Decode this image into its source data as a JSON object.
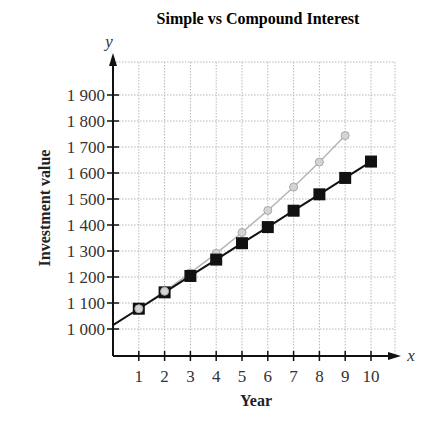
{
  "chart_data": {
    "type": "line",
    "title": "Simple vs Compound Interest",
    "xlabel": "Year",
    "ylabel": "Investment value",
    "x_var": "x",
    "y_var": "y",
    "x_ticks": [
      "1",
      "2",
      "3",
      "4",
      "5",
      "6",
      "7",
      "8",
      "9",
      "10"
    ],
    "y_ticks": [
      "1 000",
      "1 100",
      "1 200",
      "1 300",
      "1 400",
      "1 500",
      "1 600",
      "1 700",
      "1 800",
      "1 900"
    ],
    "xlim": [
      0,
      11
    ],
    "ylim": [
      1000,
      1950
    ],
    "grid": true,
    "legend": "none",
    "series": [
      {
        "name": "Compound interest",
        "marker": "circle",
        "color": "#b5b5b5",
        "x": [
          1,
          2,
          3,
          4,
          5,
          6,
          7,
          8,
          9
        ],
        "values": [
          1078,
          1145,
          1216,
          1291,
          1371,
          1456,
          1546,
          1642,
          1744
        ]
      },
      {
        "name": "Simple interest",
        "marker": "square",
        "color": "#111111",
        "x": [
          1,
          2,
          3,
          4,
          5,
          6,
          7,
          8,
          9,
          10
        ],
        "values": [
          1078,
          1141,
          1204,
          1267,
          1330,
          1392,
          1455,
          1518,
          1581,
          1644
        ]
      }
    ],
    "initial_value_at_x0": 1015
  }
}
